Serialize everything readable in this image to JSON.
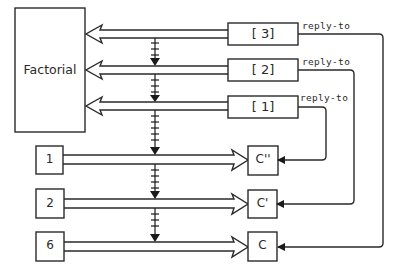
{
  "diagram": {
    "actor": {
      "label": "Factorial"
    },
    "messages": [
      {
        "id": "msg-3",
        "label": "[ 3]",
        "reply_label": "reply-to",
        "reply_target": "C"
      },
      {
        "id": "msg-2",
        "label": "[ 2]",
        "reply_label": "reply-to",
        "reply_target": "C'"
      },
      {
        "id": "msg-1",
        "label": "[ 1]",
        "reply_label": "reply-to",
        "reply_target": "C''"
      }
    ],
    "values": [
      {
        "id": "val-1",
        "label": "1",
        "target": "C''"
      },
      {
        "id": "val-2",
        "label": "2",
        "target": "C'"
      },
      {
        "id": "val-6",
        "label": "6",
        "target": "C"
      }
    ],
    "continuations": [
      {
        "id": "cont-c2",
        "label": "C''"
      },
      {
        "id": "cont-c1",
        "label": "C'"
      },
      {
        "id": "cont-c0",
        "label": "C"
      }
    ],
    "colors": {
      "stroke": "#2a2a2a",
      "background": "#ffffff"
    }
  }
}
